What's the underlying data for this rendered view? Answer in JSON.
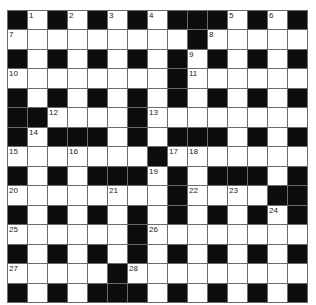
{
  "puzzle": {
    "rows": 15,
    "cols": 15,
    "colors": {
      "black": "#0d0d0d",
      "white": "#ffffff",
      "line": "#6a6a6a"
    },
    "grid": [
      "#.#.#.#.###.#.#",
      ".........#.....",
      "#.#.#.#.#.#.#.#",
      "........#......",
      "#.#.#.#.#.#.#.#",
      "##....#........",
      "#.###.#.###.#.#",
      ".......#.......",
      "#.#.###.#.###.#",
      "........#....##",
      "#.#.#.#.#.#.#.#",
      "......#........",
      "#.#.#.#.#.#.#.#",
      ".....#.........",
      "#.#.###.#.#.#.#"
    ],
    "numbers": [
      {
        "r": 0,
        "c": 1,
        "n": "1"
      },
      {
        "r": 0,
        "c": 3,
        "n": "2"
      },
      {
        "r": 0,
        "c": 5,
        "n": "3"
      },
      {
        "r": 0,
        "c": 7,
        "n": "4"
      },
      {
        "r": 0,
        "c": 11,
        "n": "5"
      },
      {
        "r": 0,
        "c": 13,
        "n": "6"
      },
      {
        "r": 1,
        "c": 0,
        "n": "7"
      },
      {
        "r": 1,
        "c": 10,
        "n": "8"
      },
      {
        "r": 2,
        "c": 9,
        "n": "9"
      },
      {
        "r": 3,
        "c": 0,
        "n": "10"
      },
      {
        "r": 3,
        "c": 9,
        "n": "11"
      },
      {
        "r": 5,
        "c": 2,
        "n": "12"
      },
      {
        "r": 5,
        "c": 7,
        "n": "13"
      },
      {
        "r": 6,
        "c": 1,
        "n": "14"
      },
      {
        "r": 7,
        "c": 0,
        "n": "15"
      },
      {
        "r": 7,
        "c": 3,
        "n": "16"
      },
      {
        "r": 7,
        "c": 8,
        "n": "17"
      },
      {
        "r": 7,
        "c": 9,
        "n": "18"
      },
      {
        "r": 8,
        "c": 7,
        "n": "19"
      },
      {
        "r": 9,
        "c": 0,
        "n": "20"
      },
      {
        "r": 9,
        "c": 5,
        "n": "21"
      },
      {
        "r": 9,
        "c": 9,
        "n": "22"
      },
      {
        "r": 9,
        "c": 11,
        "n": "23"
      },
      {
        "r": 10,
        "c": 13,
        "n": "24"
      },
      {
        "r": 11,
        "c": 0,
        "n": "25"
      },
      {
        "r": 11,
        "c": 7,
        "n": "26"
      },
      {
        "r": 13,
        "c": 0,
        "n": "27"
      },
      {
        "r": 13,
        "c": 6,
        "n": "28"
      }
    ]
  }
}
